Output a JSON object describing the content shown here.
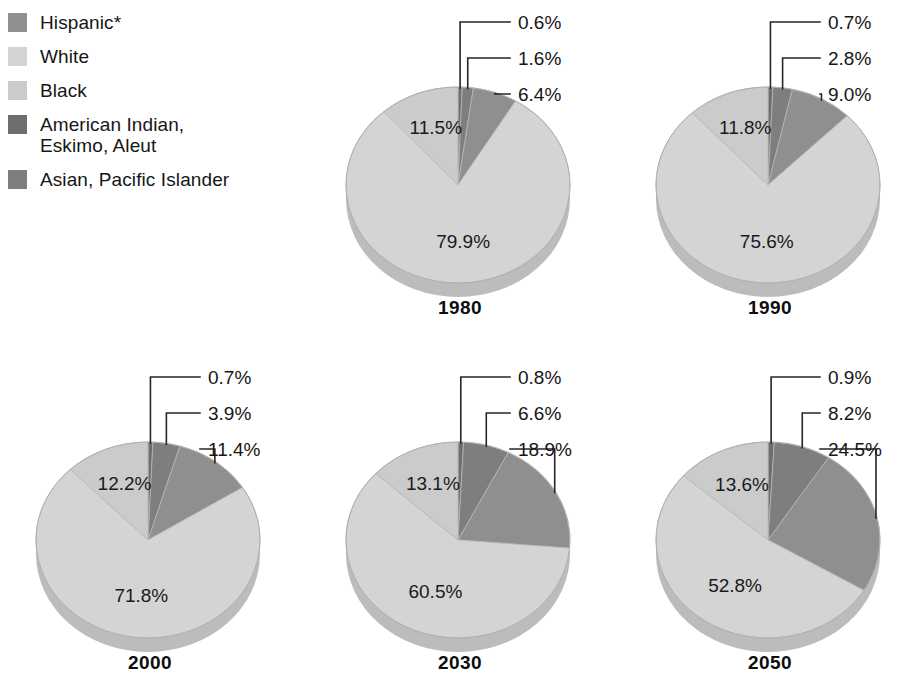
{
  "legend": {
    "items": [
      {
        "label": "Hispanic*",
        "color": "#8f8f8f",
        "key": "hispanic"
      },
      {
        "label": "White",
        "color": "#d4d4d4",
        "key": "white"
      },
      {
        "label": "Black",
        "color": "#cbcbcb",
        "key": "black"
      },
      {
        "label": "American Indian,\nEskimo, Aleut",
        "color": "#6e6e6e",
        "key": "american-indian"
      },
      {
        "label": "Asian, Pacific Islander",
        "color": "#7e7e7e",
        "key": "asian"
      }
    ]
  },
  "charts": [
    {
      "year": "1980",
      "callouts": [
        "0.6%",
        "1.6%",
        "6.4%"
      ],
      "black_label": "11.5%",
      "white_label": "79.9%"
    },
    {
      "year": "1990",
      "callouts": [
        "0.7%",
        "2.8%",
        "9.0%"
      ],
      "black_label": "11.8%",
      "white_label": "75.6%"
    },
    {
      "year": "2000",
      "callouts": [
        "0.7%",
        "3.9%",
        "11.4%"
      ],
      "black_label": "12.2%",
      "white_label": "71.8%"
    },
    {
      "year": "2030",
      "callouts": [
        "0.8%",
        "6.6%",
        "18.9%"
      ],
      "black_label": "13.1%",
      "white_label": "60.5%"
    },
    {
      "year": "2050",
      "callouts": [
        "0.9%",
        "8.2%",
        "24.5%"
      ],
      "black_label": "13.6%",
      "white_label": "52.8%"
    }
  ],
  "chart_data": {
    "type": "pie",
    "title": "",
    "note": "*Hispanic may be of any race",
    "categories": [
      "American Indian, Eskimo, Aleut",
      "Asian, Pacific Islander",
      "Hispanic*",
      "White",
      "Black"
    ],
    "colors": [
      "#6e6e6e",
      "#7e7e7e",
      "#8f8f8f",
      "#d4d4d4",
      "#cbcbcb"
    ],
    "units": "percent",
    "panels": [
      {
        "label": "1980",
        "values": [
          0.6,
          1.6,
          6.4,
          79.9,
          11.5
        ],
        "value_labels": [
          "0.6%",
          "1.6%",
          "6.4%",
          "79.9%",
          "11.5%"
        ]
      },
      {
        "label": "1990",
        "values": [
          0.7,
          2.8,
          9.0,
          75.6,
          11.8
        ],
        "value_labels": [
          "0.7%",
          "2.8%",
          "9.0%",
          "75.6%",
          "11.8%"
        ]
      },
      {
        "label": "2000",
        "values": [
          0.7,
          3.9,
          11.4,
          71.8,
          12.2
        ],
        "value_labels": [
          "0.7%",
          "3.9%",
          "11.4%",
          "71.8%",
          "12.2%"
        ]
      },
      {
        "label": "2030",
        "values": [
          0.8,
          6.6,
          18.9,
          60.5,
          13.1
        ],
        "value_labels": [
          "0.8%",
          "6.6%",
          "18.9%",
          "60.5%",
          "13.1%"
        ]
      },
      {
        "label": "2050",
        "values": [
          0.9,
          8.2,
          24.5,
          52.8,
          13.6
        ],
        "value_labels": [
          "0.9%",
          "8.2%",
          "24.5%",
          "52.8%",
          "13.6%"
        ]
      }
    ],
    "legend_position": "top-left",
    "grid": false
  }
}
